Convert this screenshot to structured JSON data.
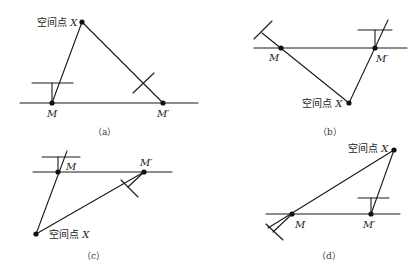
{
  "figure": {
    "panels": [
      {
        "id": "a",
        "caption": "（a）",
        "point_label_prefix": "空间点",
        "point_label_var": "X",
        "m_label": "M",
        "m_prime_label": "M′"
      },
      {
        "id": "b",
        "caption": "（b）",
        "point_label_prefix": "空间点",
        "point_label_var": "X",
        "m_label": "M",
        "m_prime_label": "M′"
      },
      {
        "id": "c",
        "caption": "（c）",
        "point_label_prefix": "空间点",
        "point_label_var": "X",
        "m_label": "M",
        "m_prime_label": "M′"
      },
      {
        "id": "d",
        "caption": "（d）",
        "point_label_prefix": "空间点",
        "point_label_var": "X",
        "m_label": "M",
        "m_prime_label": "M′"
      }
    ]
  }
}
